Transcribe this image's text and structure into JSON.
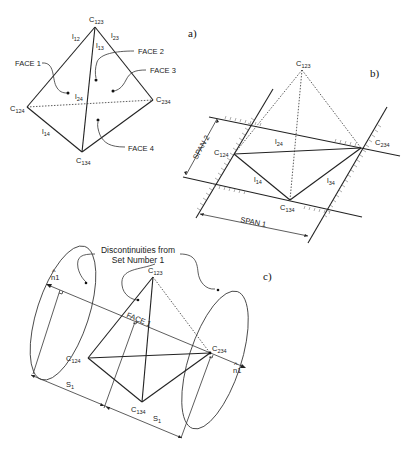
{
  "figure": {
    "panels": [
      {
        "id": "a",
        "label": "a)",
        "vertices": {
          "c123": {
            "base": "C",
            "sub": "123"
          },
          "c124": {
            "base": "C",
            "sub": "124"
          },
          "c234": {
            "base": "C",
            "sub": "234"
          },
          "c134": {
            "base": "C",
            "sub": "134"
          }
        },
        "edges": {
          "l12": {
            "base": "l",
            "sub": "12"
          },
          "l13": {
            "base": "l",
            "sub": "13"
          },
          "l23": {
            "base": "l",
            "sub": "23"
          },
          "l24": {
            "base": "l",
            "sub": "24"
          },
          "l14": {
            "base": "l",
            "sub": "14"
          }
        },
        "faces": [
          "FACE 1",
          "FACE 2",
          "FACE 3",
          "FACE 4"
        ]
      },
      {
        "id": "b",
        "label": "b)",
        "vertices": {
          "c123": {
            "base": "C",
            "sub": "123"
          },
          "c124": {
            "base": "C",
            "sub": "124"
          },
          "c234": {
            "base": "C",
            "sub": "234"
          },
          "c134": {
            "base": "C",
            "sub": "134"
          }
        },
        "edges": {
          "l24": {
            "base": "l",
            "sub": "24"
          },
          "l14": {
            "base": "l",
            "sub": "14"
          },
          "l34": {
            "base": "l",
            "sub": "34"
          }
        },
        "spans": [
          "SPAN 1",
          "SPAN 2"
        ]
      },
      {
        "id": "c",
        "label": "c)",
        "vertices": {
          "c123": {
            "base": "C",
            "sub": "123"
          },
          "c124": {
            "base": "C",
            "sub": "124"
          },
          "c234": {
            "base": "C",
            "sub": "234"
          },
          "c134": {
            "base": "C",
            "sub": "134"
          }
        },
        "face": "FACE 1",
        "normal": {
          "hat": "^",
          "text": "n1"
        },
        "spacing": {
          "base": "S",
          "sub": "1"
        },
        "annotation": [
          "Discontinuities from",
          "Set Number 1"
        ]
      }
    ]
  }
}
